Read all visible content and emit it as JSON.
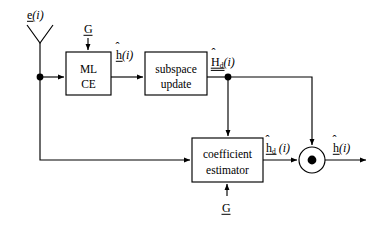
{
  "figure": {
    "type": "block-diagram",
    "domain": "signal-processing-channel-estimation",
    "background_color": "#ffffff",
    "line_color": "#000000"
  },
  "blocks": [
    {
      "id": "ml-ce",
      "line1": "ML",
      "line2": "CE",
      "x": 66,
      "y": 52,
      "w": 45,
      "h": 43
    },
    {
      "id": "subspace-update",
      "line1": "subspace",
      "line2": "update",
      "x": 145,
      "y": 52,
      "w": 62,
      "h": 43
    },
    {
      "id": "coefficient-estimator",
      "line1": "coefficient",
      "line2": "estimator",
      "x": 192,
      "y": 138,
      "w": 71,
      "h": 44
    }
  ],
  "signals": {
    "antenna_input": {
      "base": "e",
      "paren": "(i)",
      "underline": true,
      "hat": false
    },
    "ml_ce_gain": {
      "base": "G",
      "underline": true
    },
    "ml_ce_output": {
      "base": "h",
      "paren": "(i)",
      "underline": true,
      "hat": true
    },
    "subspace_output": {
      "base": "H",
      "sub": "d",
      "paren": "(i)",
      "underline": true,
      "hat": true,
      "double_underline": true
    },
    "coef_output": {
      "base": "h",
      "sub": "d",
      "paren": "(i)",
      "underline": true,
      "hat": true
    },
    "coef_gain": {
      "base": "G",
      "underline": true
    },
    "final_output": {
      "base": "h",
      "paren": "(i)",
      "underline": true,
      "hat": true
    }
  },
  "labels": {
    "antenna_input_text": "e(i)",
    "ml_ce_gain_text": "G",
    "ml_ce_output_text": "h(i)",
    "subspace_output_text": "H_d(i)",
    "coef_output_text": "h_d(i)",
    "coef_gain_text": "G",
    "final_output_text": "h(i)",
    "ml_ce_line1": "ML",
    "ml_ce_line2": "CE",
    "subspace_line1": "subspace",
    "subspace_line2": "update",
    "coef_line1": "coefficient",
    "coef_line2": "estimator"
  },
  "nodes": {
    "antenna": {
      "apex_x": 40,
      "apex_y": 43,
      "spread": 13,
      "top_y": 25
    },
    "junction_left": {
      "x": 40,
      "y": 77
    },
    "junction_subspace": {
      "x": 228,
      "y": 77
    },
    "multiplier": {
      "cx": 312,
      "cy": 160,
      "r": 13,
      "dot_r": 4.5,
      "symbol": "dot-product"
    }
  },
  "connections": [
    {
      "from": "antenna",
      "to": "junction-left",
      "type": "vertical"
    },
    {
      "from": "junction-left",
      "to": "ml-ce",
      "type": "horizontal-arrow"
    },
    {
      "from": "gain-G-top",
      "to": "ml-ce",
      "type": "vertical-arrow"
    },
    {
      "from": "ml-ce",
      "to": "subspace-update",
      "type": "horizontal-arrow"
    },
    {
      "from": "subspace-update",
      "to": "junction-subspace",
      "type": "horizontal"
    },
    {
      "from": "junction-subspace",
      "to": "coefficient-estimator",
      "type": "vertical-arrow"
    },
    {
      "from": "junction-subspace",
      "to": "multiplier",
      "type": "routed-arrow"
    },
    {
      "from": "junction-left",
      "to": "coefficient-estimator",
      "type": "feedback-arrow"
    },
    {
      "from": "gain-G-bottom",
      "to": "coefficient-estimator",
      "type": "vertical-arrow-up"
    },
    {
      "from": "coefficient-estimator",
      "to": "multiplier",
      "type": "horizontal-arrow"
    },
    {
      "from": "multiplier",
      "to": "output",
      "type": "horizontal-arrow"
    }
  ]
}
